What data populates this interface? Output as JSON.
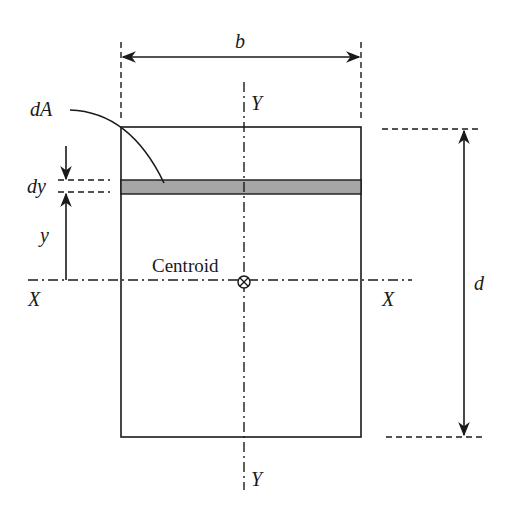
{
  "diagram": {
    "labels": {
      "width": "b",
      "depth": "d",
      "area_element": "dA",
      "strip_thickness": "dy",
      "distance": "y",
      "x_axis_left": "X",
      "x_axis_right": "X",
      "y_axis_top": "Y",
      "y_axis_bottom": "Y",
      "centroid": "Centroid"
    },
    "icons": {
      "centroid_marker": "circle-cross-icon"
    },
    "colors": {
      "line": "#1a1a1a",
      "strip_fill": "#a6a6a6",
      "background": "#ffffff"
    }
  }
}
